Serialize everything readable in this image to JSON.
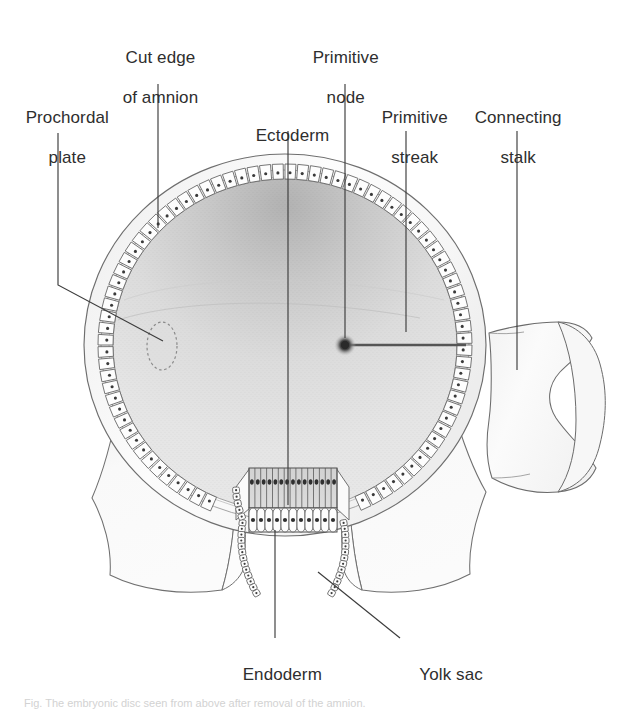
{
  "figure": {
    "background": "#ffffff",
    "ink": "#2e2e2e",
    "line_color": "#3a3a3a",
    "cavity_fill_top": "#bcbcbc",
    "cavity_fill_bottom": "#e6e6e6",
    "amnion_fill": "#fbfbfb",
    "cell_fill": "#fdfdfd",
    "ectoderm_fill": "#d9d9d9"
  },
  "labels": [
    {
      "id": "prochordal-plate",
      "line1": "Prochordal",
      "line2": "plate",
      "x": 16,
      "y": 88
    },
    {
      "id": "cut-edge-amnion",
      "line1": "Cut edge",
      "line2": "of amnion",
      "x": 113,
      "y": 28
    },
    {
      "id": "ectoderm",
      "line1": "Ectoderm",
      "line2": "",
      "x": 246,
      "y": 106
    },
    {
      "id": "primitive-node",
      "line1": "Primitive",
      "line2": "node",
      "x": 303,
      "y": 28
    },
    {
      "id": "primitive-streak",
      "line1": "Primitive",
      "line2": "streak",
      "x": 372,
      "y": 88
    },
    {
      "id": "connecting-stalk",
      "line1": "Connecting",
      "line2": "stalk",
      "x": 465,
      "y": 88
    },
    {
      "id": "endoderm",
      "line1": "Endoderm",
      "line2": "",
      "x": 233,
      "y": 645
    },
    {
      "id": "yolk-sac",
      "line1": "Yolk sac",
      "line2": "",
      "x": 410,
      "y": 645
    }
  ],
  "structures": {
    "prochordal_plate": "dashed-oval-marker",
    "primitive_node": "dark-dot-marker",
    "primitive_streak": "horizontal-line-marker",
    "amnion": "outer-shell",
    "amniotic_cavity": "inner-cavity",
    "ectoderm": "columnar-cell-row",
    "endoderm": "rounded-cell-row",
    "yolk_sac": "lower-lobes",
    "connecting_stalk": "anvil-shape-right"
  },
  "caption": {
    "text": "Fig.  The embryonic disc seen from above after removal of the amnion."
  }
}
